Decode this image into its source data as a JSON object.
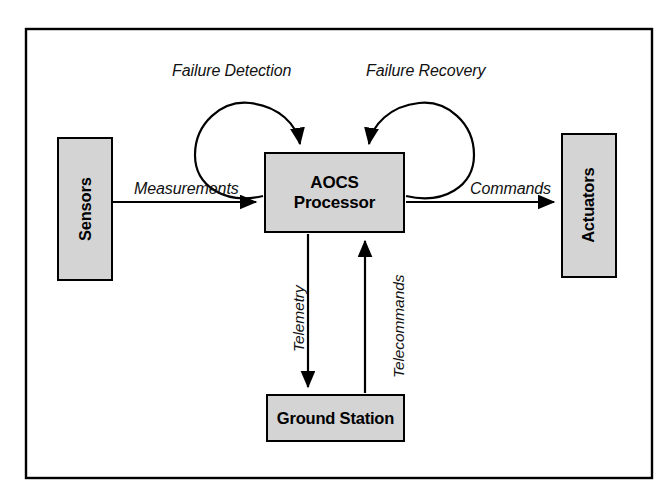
{
  "figure": {
    "border_color": "#000000",
    "node_fill": "#d4d4d4",
    "background": "#ffffff"
  },
  "nodes": {
    "sensors": {
      "label": "Sensors",
      "orientation": "vertical"
    },
    "actuators": {
      "label": "Actuators",
      "orientation": "vertical"
    },
    "processor": {
      "label": "AOCS\nProcessor",
      "orientation": "horizontal"
    },
    "ground": {
      "label": "Ground Station",
      "orientation": "horizontal"
    }
  },
  "edges": {
    "measurements": {
      "label": "Measurements",
      "from": "sensors",
      "to": "processor",
      "direction": "right"
    },
    "commands": {
      "label": "Commands",
      "from": "processor",
      "to": "actuators",
      "direction": "right"
    },
    "telemetry": {
      "label": "Telemetry",
      "from": "processor",
      "to": "ground",
      "direction": "down"
    },
    "telecommands": {
      "label": "Telecommands",
      "from": "ground",
      "to": "processor",
      "direction": "up"
    },
    "failure_detection": {
      "label": "Failure Detection",
      "from": "processor",
      "to": "processor",
      "direction": "self-loop-left"
    },
    "failure_recovery": {
      "label": "Failure Recovery",
      "from": "processor",
      "to": "processor",
      "direction": "self-loop-right"
    }
  }
}
